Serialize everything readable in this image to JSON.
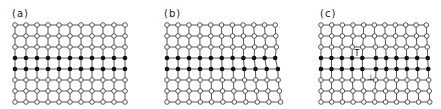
{
  "figure": {
    "panels": [
      {
        "id": "a",
        "label": "(a)",
        "label_x": 12,
        "origin": [
          15,
          25
        ],
        "cols": 11,
        "rows": 8,
        "dx": 11,
        "dy": 11,
        "black_rows": [
          3,
          4
        ],
        "description": "Perfect lattice",
        "distortion": "none",
        "symbols": []
      },
      {
        "id": "b",
        "label": "(b)",
        "label_x": 17,
        "origin": [
          20,
          25
        ],
        "cols": 11,
        "rows": 8,
        "dx": 11,
        "dy": 11,
        "black_rows": [
          3,
          4
        ],
        "description": "Lattice with bent rows",
        "distortion": "bend",
        "symbols": []
      },
      {
        "id": "c",
        "label": "(c)",
        "label_x": 26,
        "origin": [
          27,
          25
        ],
        "cols": 11,
        "rows": 8,
        "dx": 10.7,
        "dy": 11,
        "black_rows": [
          3,
          4
        ],
        "description": "Lattice with dislocation dipole",
        "distortion": "dipole",
        "symbols": [
          {
            "glyph": "T",
            "x": 63,
            "y": 56,
            "name": "dislocation-down-symbol"
          },
          {
            "glyph": "⊥",
            "x": 77,
            "y": 80,
            "name": "dislocation-up-symbol"
          }
        ]
      }
    ],
    "colors": {
      "line": "#555555",
      "open_node_fill": "#ffffff",
      "open_node_stroke": "#444444",
      "filled_node": "#111111"
    }
  }
}
